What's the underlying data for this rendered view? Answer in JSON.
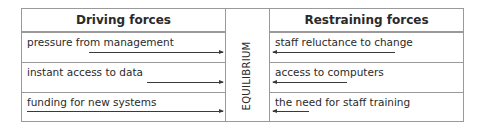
{
  "diagram": {
    "driving": {
      "header": "Driving forces",
      "items": [
        {
          "label": "pressure from management",
          "arrow_start_x": 89,
          "arrow_end_x": 223
        },
        {
          "label": "instant access to data",
          "arrow_start_x": 147,
          "arrow_end_x": 223
        },
        {
          "label": "funding for new systems",
          "arrow_start_x": 27,
          "arrow_end_x": 223
        }
      ]
    },
    "center": {
      "label": "EQUILIBRIUM"
    },
    "restraining": {
      "header": "Restraining forces",
      "items": [
        {
          "label": "staff reluctance to change",
          "arrow_start_x": 395,
          "arrow_end_x": 273
        },
        {
          "label": "access to computers",
          "arrow_start_x": 347,
          "arrow_end_x": 273
        },
        {
          "label": "the need for staff training",
          "arrow_start_x": 309,
          "arrow_end_x": 273
        }
      ]
    },
    "colors": {
      "border": "#9a9a9a",
      "text": "#2a2a2a",
      "arrow": "#3a3a3a"
    }
  }
}
